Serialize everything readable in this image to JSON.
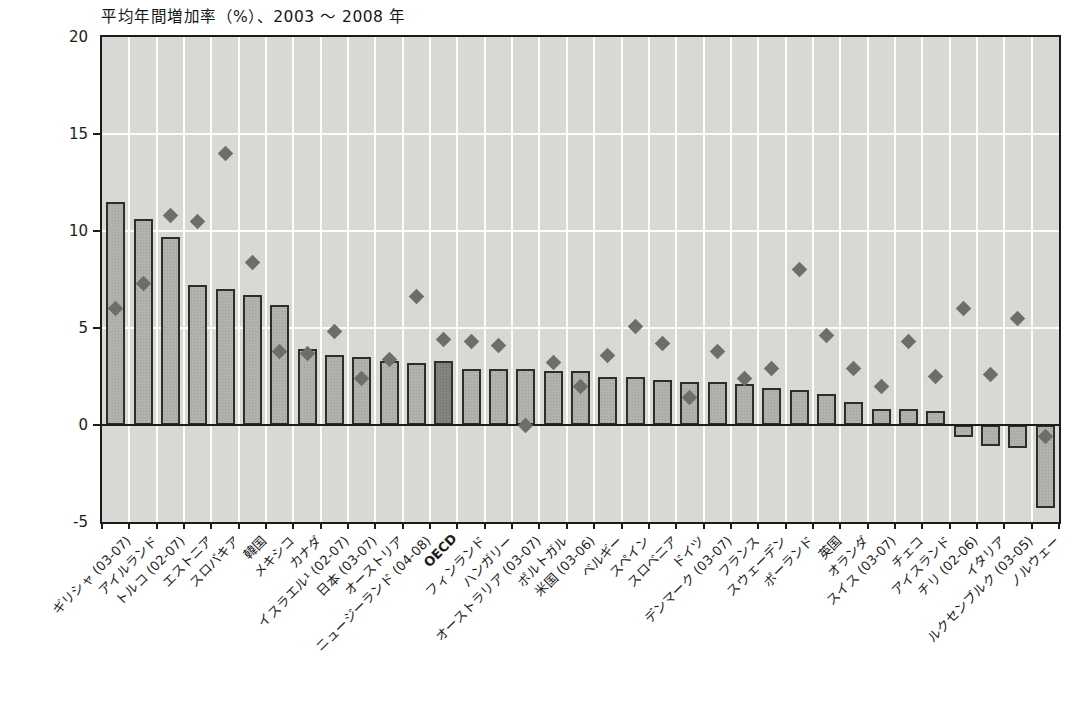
{
  "figure": {
    "title": "平均年間増加率（%）、2003 ～ 2008 年"
  },
  "colors": {
    "page_background": "#ffffff",
    "plot_background": "#d9d8d4",
    "bar_fill": "#b3b1ab",
    "bar_border": "#2e2d2a",
    "oecd_bar_fill": "#868480",
    "diamond_fill": "#6e6d6a",
    "gridline": "#ffffff",
    "axis_line": "#1d1c1a",
    "text": "#1b1b1a"
  },
  "chart_data": {
    "type": "bar",
    "title": "平均年間増加率（%）、2003 ～ 2008 年",
    "xlabel": "",
    "ylabel": "",
    "ylim": [
      -5,
      20
    ],
    "yticks": [
      20,
      15,
      10,
      5,
      0,
      -5
    ],
    "grid": true,
    "legend_position": "none",
    "highlight_category": "OECD",
    "categories": [
      "ギリシャ (03-07)",
      "アイルランド",
      "トルコ (02-07)",
      "エストニア",
      "スロバキア",
      "韓国",
      "メキシコ",
      "カナダ",
      "イスラエル¹ (02-07)",
      "日本 (03-07)",
      "オーストリア",
      "ニュージーランド (04-08)",
      "OECD",
      "フィンランド",
      "ハンガリー",
      "オーストラリア (03-07)",
      "ポルトガル",
      "米国 (03-06)",
      "ベルギー",
      "スペイン",
      "スロベニア",
      "ドイツ",
      "デンマーク (03-07)",
      "フランス",
      "スウェーデン",
      "ポーランド",
      "英国",
      "オランダ",
      "スイス (03-07)",
      "チェコ",
      "アイスランド",
      "チリ (02-06)",
      "イタリア",
      "ルクセンブルク (03-05)",
      "ノルウェー"
    ],
    "series": [
      {
        "name": "bars",
        "type": "bar",
        "values": [
          11.5,
          10.6,
          9.7,
          7.2,
          7.0,
          6.7,
          6.2,
          3.9,
          3.6,
          3.5,
          3.3,
          3.2,
          3.3,
          2.9,
          2.9,
          2.9,
          2.8,
          2.8,
          2.5,
          2.5,
          2.3,
          2.2,
          2.2,
          2.1,
          1.9,
          1.8,
          1.6,
          1.2,
          0.8,
          0.8,
          0.7,
          -0.6,
          -1.1,
          -1.2,
          -4.3
        ]
      },
      {
        "name": "diamond_markers",
        "type": "scatter",
        "marker": "diamond",
        "values": [
          6.0,
          7.3,
          10.8,
          10.5,
          14.0,
          8.4,
          3.8,
          3.7,
          4.8,
          2.4,
          3.4,
          6.6,
          4.4,
          4.3,
          4.1,
          0.0,
          3.2,
          2.0,
          3.6,
          5.1,
          4.2,
          1.4,
          3.8,
          2.4,
          2.9,
          8.0,
          4.6,
          2.9,
          2.0,
          4.3,
          2.5,
          6.0,
          2.6,
          5.5,
          -0.6
        ]
      }
    ]
  }
}
